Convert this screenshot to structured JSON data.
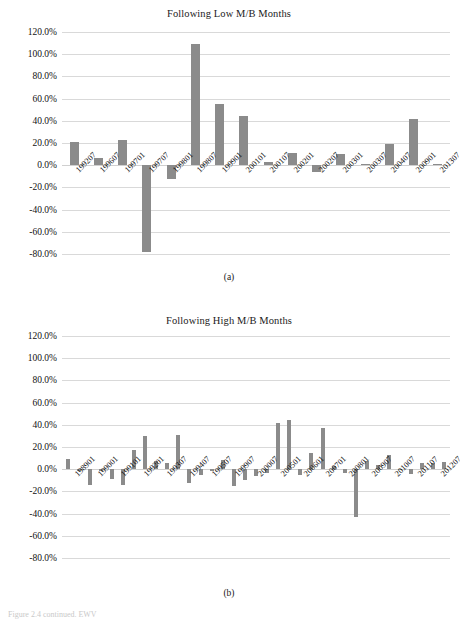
{
  "figure": {
    "caption_fragment": "Figure 2.4 continued. EWV",
    "panel_a_caption": "(a)",
    "panel_b_caption": "(b)"
  },
  "chart_data": [
    {
      "type": "bar",
      "panel": "a",
      "title": "Following Low M/B Months",
      "xlabel": "",
      "ylabel": "",
      "ylim": [
        -80,
        120
      ],
      "ytick_labels": [
        "120.0%",
        "100.0%",
        "80.0%",
        "60.0%",
        "40.0%",
        "20.0%",
        "0.0%",
        "-20.0%",
        "-40.0%",
        "-60.0%",
        "-80.0%"
      ],
      "ytick_values": [
        120,
        100,
        80,
        60,
        40,
        20,
        0,
        -20,
        -40,
        -60,
        -80
      ],
      "grid": true,
      "legend": "none",
      "categories": [
        "199207",
        "199607",
        "199701",
        "199707",
        "199801",
        "199807",
        "199901",
        "200101",
        "200107",
        "200201",
        "200207",
        "200301",
        "200307",
        "200407",
        "200901",
        "201307"
      ],
      "values": [
        21.0,
        6.5,
        23.0,
        -78.0,
        -12.0,
        109.0,
        55.5,
        44.5,
        3.0,
        11.0,
        -6.0,
        10.0,
        1.5,
        19.0,
        42.0,
        1.5
      ]
    },
    {
      "type": "bar",
      "panel": "b",
      "title": "Following High M/B Months",
      "xlabel": "",
      "ylabel": "",
      "ylim": [
        -80,
        120
      ],
      "ytick_labels": [
        "120.0%",
        "100.0%",
        "80.0%",
        "60.0%",
        "40.0%",
        "20.0%",
        "0.0%",
        "-20.0%",
        "-40.0%",
        "-60.0%",
        "-80.0%"
      ],
      "ytick_values": [
        120,
        100,
        80,
        60,
        40,
        20,
        0,
        -20,
        -40,
        -60,
        -80
      ],
      "grid": true,
      "legend": "none",
      "categories": [
        "198901",
        "199001",
        "199101",
        "199201",
        "199307",
        "199407",
        "199507",
        "199907",
        "200007",
        "200501",
        "200601",
        "200701",
        "200801",
        "200907",
        "201007",
        "201107",
        "201207"
      ],
      "values": [
        9.5,
        -2.0,
        -14.0,
        -1.5,
        -9.0,
        -14.0,
        17.0,
        30.0,
        7.5,
        5.5,
        30.5,
        -12.0,
        -5.5,
        -1.5,
        8.0,
        -15.0,
        -9.5,
        -6.5,
        -3.5,
        41.5,
        44.5,
        -5.0,
        14.5,
        37.5,
        2.5,
        -3.0,
        -43.0,
        7.5,
        4.0,
        13.0,
        -1.0,
        -4.5,
        5.5,
        6.0,
        6.5
      ]
    }
  ]
}
